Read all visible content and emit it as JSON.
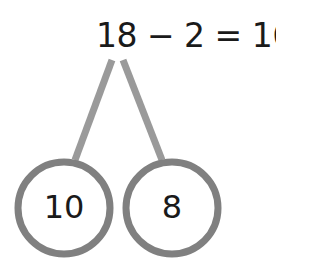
{
  "equation": {
    "text": "18 − 2 = 16"
  },
  "bond": {
    "parts": [
      {
        "label": "10"
      },
      {
        "label": "8"
      }
    ],
    "line_color": "#999999",
    "circle_color": "#808080"
  }
}
